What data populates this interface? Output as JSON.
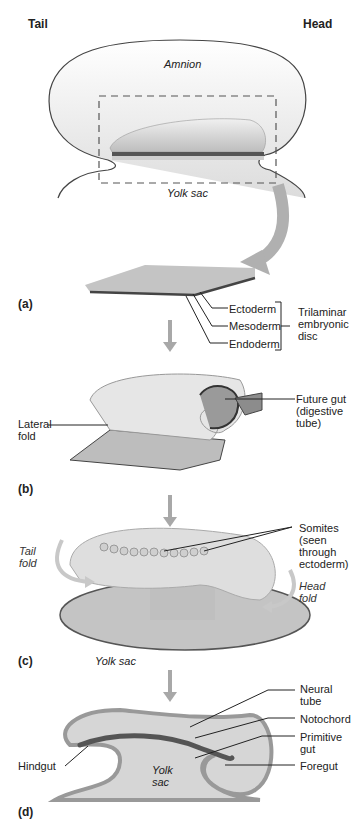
{
  "orientation": {
    "left": "Tail",
    "right": "Head"
  },
  "top": {
    "amnion": "Amnion",
    "yolk_sac": "Yolk sac"
  },
  "panel_a": {
    "tag": "(a)",
    "layers": [
      "Ectoderm",
      "Mesoderm",
      "Endoderm"
    ],
    "group_label": [
      "Trilaminar",
      "embryonic",
      "disc"
    ]
  },
  "panel_b": {
    "tag": "(b)",
    "lateral_fold": [
      "Lateral",
      "fold"
    ],
    "future_gut": [
      "Future gut",
      "(digestive",
      "tube)"
    ]
  },
  "panel_c": {
    "tag": "(c)",
    "somites": [
      "Somites",
      "(seen",
      "through",
      "ectoderm)"
    ],
    "tail_fold": [
      "Tail",
      "fold"
    ],
    "head_fold": [
      "Head",
      "fold"
    ],
    "yolk_sac": "Yolk sac"
  },
  "panel_d": {
    "tag": "(d)",
    "neural_tube": [
      "Neural",
      "tube"
    ],
    "notochord": "Notochord",
    "primitive_gut": [
      "Primitive",
      "gut"
    ],
    "foregut": "Foregut",
    "hindgut": "Hindgut",
    "yolk_sac": [
      "Yolk",
      "sac"
    ]
  },
  "colors": {
    "tissue": "#c8c8c8",
    "dark_layer": "#555555",
    "arrow": "#a8a8a8",
    "outline": "#444444"
  }
}
